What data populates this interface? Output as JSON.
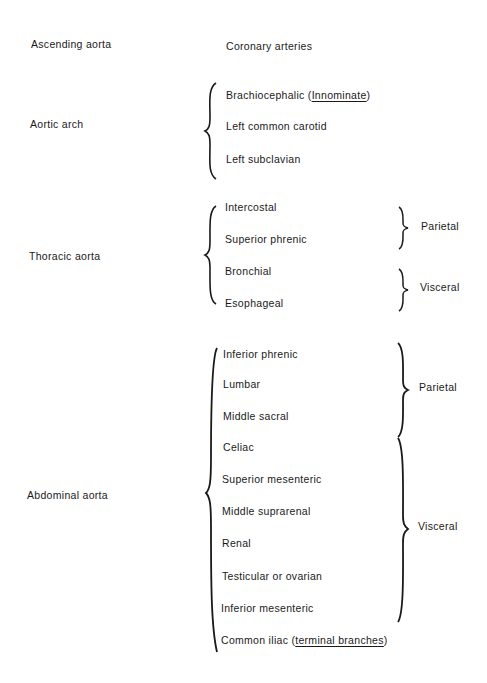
{
  "sections": [
    {
      "label": "Ascending aorta",
      "branches": [
        {
          "name": "Coronary arteries"
        }
      ]
    },
    {
      "label": "Aortic arch",
      "branches": [
        {
          "name": "Brachiocephalic",
          "note_open": " (",
          "note": "Innominate",
          "note_close": ")"
        },
        {
          "name": "Left common carotid"
        },
        {
          "name": "Left subclavian"
        }
      ]
    },
    {
      "label": "Thoracic aorta",
      "branches": [
        {
          "name": "Intercostal"
        },
        {
          "name": "Superior phrenic"
        },
        {
          "name": "Bronchial"
        },
        {
          "name": "Esophageal"
        }
      ],
      "groups": [
        {
          "label": "Parietal"
        },
        {
          "label": "Visceral"
        }
      ]
    },
    {
      "label": "Abdominal aorta",
      "branches": [
        {
          "name": "Inferior phrenic"
        },
        {
          "name": "Lumbar"
        },
        {
          "name": "Middle sacral"
        },
        {
          "name": "Celiac"
        },
        {
          "name": "Superior mesenteric"
        },
        {
          "name": "Middle suprarenal"
        },
        {
          "name": "Renal"
        },
        {
          "name": "Testicular or ovarian"
        },
        {
          "name": "Inferior mesenteric"
        },
        {
          "name": "Common iliac",
          "note_open": " (",
          "note": "terminal branches",
          "note_close": ")"
        }
      ],
      "groups": [
        {
          "label": "Parietal"
        },
        {
          "label": "Visceral"
        }
      ]
    }
  ],
  "colors": {
    "text": "#1a1a1a",
    "background": "#ffffff"
  }
}
